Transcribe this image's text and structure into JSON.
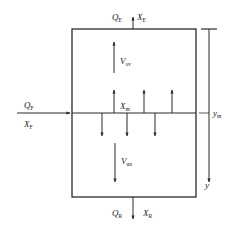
{
  "diagram": {
    "type": "column-flow-schematic",
    "labels": {
      "top_flow": {
        "q": "Q",
        "q_sub": "E",
        "x": "X",
        "x_sub": "E"
      },
      "feed_flow": {
        "q": "Q",
        "q_sub": "F",
        "x": "X",
        "x_sub": "F"
      },
      "bottom_flow": {
        "q": "Q",
        "q_sub": "R",
        "x": "X",
        "x_sub": "R"
      },
      "upper_velocity": {
        "v": "V",
        "v_sub": "ov"
      },
      "lower_velocity": {
        "v": "V",
        "v_sub": "un"
      },
      "interface_conc": {
        "x": "X",
        "x_sub": "m"
      },
      "axis_feed_level": {
        "y": "y",
        "y_sub": "m"
      },
      "axis_label": "y"
    },
    "colors": {
      "line": "#2a2a2a",
      "text": "#222222",
      "background": "#ffffff"
    }
  }
}
